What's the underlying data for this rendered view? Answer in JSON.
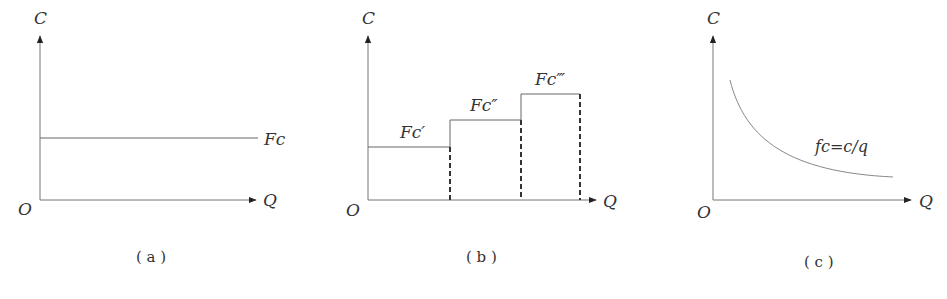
{
  "figure": {
    "panels": [
      {
        "id": "a",
        "caption": "( a )",
        "y_axis_label": "C",
        "x_axis_label": "Q",
        "origin_label": "O",
        "curve_label": "Fc"
      },
      {
        "id": "b",
        "caption": "( b )",
        "y_axis_label": "C",
        "x_axis_label": "Q",
        "origin_label": "O",
        "step_labels": [
          "Fc′",
          "Fc″",
          "Fc‴"
        ]
      },
      {
        "id": "c",
        "caption": "( c )",
        "y_axis_label": "C",
        "x_axis_label": "Q",
        "origin_label": "O",
        "curve_label": "fc=c/q"
      }
    ]
  },
  "colors": {
    "line": "#555555",
    "text": "#333333"
  }
}
